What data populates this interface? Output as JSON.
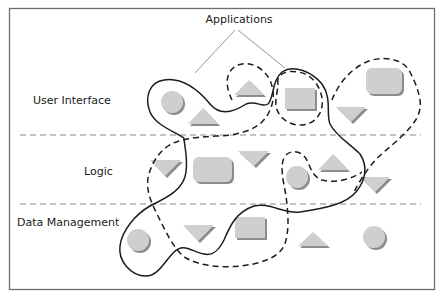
{
  "diagram": {
    "title": "Applications",
    "tiers": [
      {
        "label": "User Interface"
      },
      {
        "label": "Logic"
      },
      {
        "label": "Data Management"
      }
    ],
    "legend": {
      "solid_outline": "application (solid boundary)",
      "dashed_outline": "application (dashed boundary)"
    },
    "colors": {
      "shape_fill": "#cfcfcf",
      "shape_shadow": "#9a9a9a",
      "outline": "#1c1c1c",
      "divider": "#8a8a8a",
      "frame": "#6e6e6e"
    },
    "components": {
      "user_interface": [
        {
          "shape": "circle",
          "x": 172,
          "y": 102
        },
        {
          "shape": "triangle-up",
          "x": 202,
          "y": 114
        },
        {
          "shape": "triangle-up",
          "x": 248,
          "y": 86
        },
        {
          "shape": "rectangle",
          "x": 301,
          "y": 99
        },
        {
          "shape": "rounded-rectangle",
          "x": 384,
          "y": 81
        },
        {
          "shape": "triangle-down",
          "x": 350,
          "y": 115
        }
      ],
      "logic": [
        {
          "shape": "triangle-down",
          "x": 165,
          "y": 167
        },
        {
          "shape": "rounded-rectangle",
          "x": 212,
          "y": 170
        },
        {
          "shape": "triangle-down",
          "x": 253,
          "y": 157
        },
        {
          "shape": "circle",
          "x": 297,
          "y": 178
        },
        {
          "shape": "triangle-up",
          "x": 333,
          "y": 163
        },
        {
          "shape": "triangle-down",
          "x": 375,
          "y": 183
        }
      ],
      "data_management": [
        {
          "shape": "circle",
          "x": 139,
          "y": 241
        },
        {
          "shape": "triangle-down",
          "x": 198,
          "y": 234
        },
        {
          "shape": "rectangle",
          "x": 251,
          "y": 227
        },
        {
          "shape": "triangle-up",
          "x": 313,
          "y": 240
        },
        {
          "shape": "circle",
          "x": 374,
          "y": 237
        }
      ]
    }
  }
}
